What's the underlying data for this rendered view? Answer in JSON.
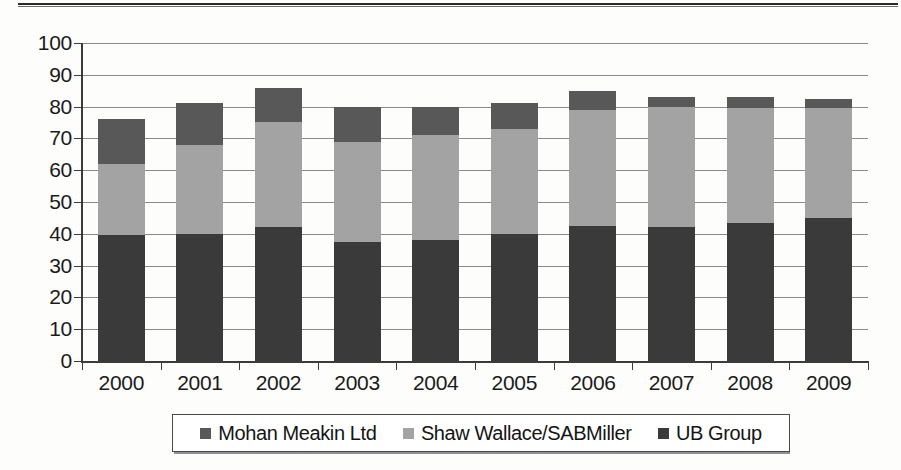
{
  "chart_data": {
    "type": "bar",
    "subtype": "stacked-bar",
    "title": "",
    "xlabel": "",
    "ylabel": "",
    "categories": [
      "2000",
      "2001",
      "2002",
      "2003",
      "2004",
      "2005",
      "2006",
      "2007",
      "2008",
      "2009"
    ],
    "series": [
      {
        "name": "UB Group",
        "color": "#3a3a3a",
        "values": [
          39.5,
          40.0,
          42.0,
          37.5,
          38.0,
          40.0,
          42.5,
          42.0,
          43.5,
          45.0
        ]
      },
      {
        "name": "Shaw Wallace/SABMiller",
        "color": "#a3a3a3",
        "values": [
          22.5,
          28.0,
          33.0,
          31.5,
          33.0,
          33.0,
          36.5,
          38.0,
          36.0,
          34.5
        ]
      },
      {
        "name": "Mohan Meakin Ltd",
        "color": "#585858",
        "values": [
          14.0,
          13.0,
          11.0,
          11.0,
          9.0,
          8.0,
          6.0,
          3.0,
          3.5,
          3.0
        ]
      }
    ],
    "stack_order_bottom_to_top": [
      "UB Group",
      "Shaw Wallace/SABMiller",
      "Mohan Meakin Ltd"
    ],
    "totals": [
      76.0,
      81.0,
      86.0,
      80.0,
      80.0,
      81.0,
      85.0,
      83.0,
      83.0,
      82.5
    ],
    "ylim": [
      0,
      100
    ],
    "ytick_step": 10,
    "ytick_labels": [
      "0",
      "10",
      "20",
      "30",
      "40",
      "50",
      "60",
      "70",
      "80",
      "90",
      "100"
    ],
    "grid": true,
    "legend_position": "bottom"
  },
  "legend": {
    "items": [
      {
        "label": "Mohan Meakin Ltd",
        "color": "#585858",
        "swatch_name": "legend-swatch-mohan-meakin"
      },
      {
        "label": "Shaw Wallace/SABMiller",
        "color": "#a3a3a3",
        "swatch_name": "legend-swatch-shaw-wallace"
      },
      {
        "label": "UB Group",
        "color": "#3a3a3a",
        "swatch_name": "legend-swatch-ub-group"
      }
    ]
  },
  "colors": {
    "axis": "#3b3b3b",
    "grid": "#8a8a8a",
    "text": "#1a1a1a",
    "background": "#fdfdfc",
    "series_top": "#585858",
    "series_middle": "#a3a3a3",
    "series_bottom": "#3a3a3a"
  }
}
